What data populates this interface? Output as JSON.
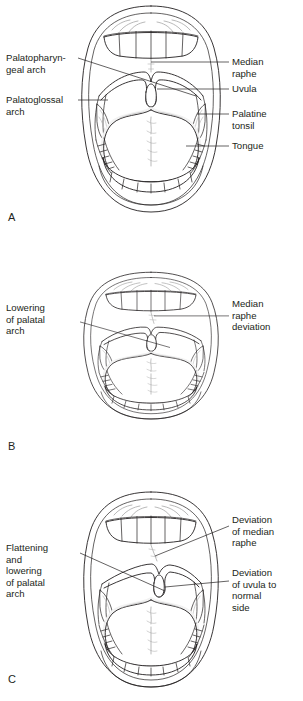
{
  "figure": {
    "background_color": "#ffffff",
    "ink_color": "#231f20",
    "accent_gray": "#9b9b9b"
  },
  "panels": [
    {
      "letter": "A",
      "name": "normal-oral-cavity",
      "labels_left": [
        {
          "id": "palatopharyngeal-arch",
          "text": "Palatopharyn-\ngeal arch"
        },
        {
          "id": "palatoglossal-arch",
          "text": "Palatoglossal\narch"
        }
      ],
      "labels_right": [
        {
          "id": "median-raphe",
          "text": "Median\nraphe"
        },
        {
          "id": "uvula",
          "text": "Uvula"
        },
        {
          "id": "palatine-tonsil",
          "text": "Palatine\ntonsil"
        },
        {
          "id": "tongue",
          "text": "Tongue"
        }
      ]
    },
    {
      "letter": "B",
      "name": "lowered-palatal-arch",
      "labels_left": [
        {
          "id": "lowering-of-palatal-arch",
          "text": "Lowering\nof palatal\narch"
        }
      ],
      "labels_right": [
        {
          "id": "median-raphe-deviation",
          "text": "Median\nraphe\ndeviation"
        }
      ]
    },
    {
      "letter": "C",
      "name": "flattened-palatal-arch",
      "labels_left": [
        {
          "id": "flattening-and-lowering-of-palatal-arch",
          "text": "Flattening\nand\nlowering\nof palatal\narch"
        }
      ],
      "labels_right": [
        {
          "id": "deviation-of-median-raphe",
          "text": "Deviation\nof median\nraphe"
        },
        {
          "id": "deviation-of-uvula-to-normal-side",
          "text": "Deviation\nof uvula to\nnormal\nside"
        }
      ]
    }
  ]
}
